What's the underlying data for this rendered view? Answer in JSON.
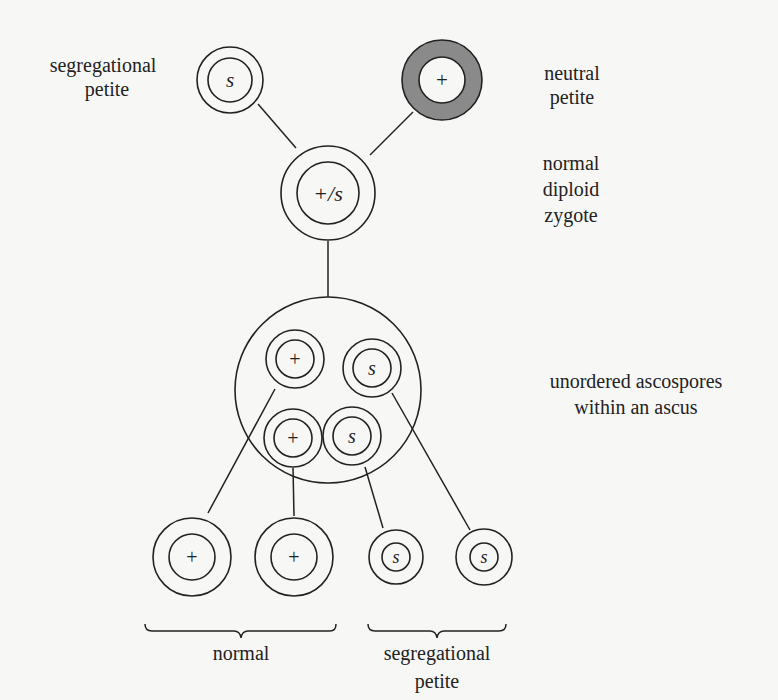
{
  "diagram": {
    "colors": {
      "background": "#f7f7f6",
      "ink": "#222222",
      "neutral_shading": "#8a8a8a"
    },
    "labels": {
      "segregational_petite_top_line1": "segregational",
      "segregational_petite_top_line2": "petite",
      "neutral_petite_line1": "neutral",
      "neutral_petite_line2": "petite",
      "zygote_line1": "normal",
      "zygote_line2": "diploid",
      "zygote_line3": "zygote",
      "ascus_line1": "unordered ascospores",
      "ascus_line2": "within an ascus",
      "normal_group": "normal",
      "seg_group_line1": "segregational",
      "seg_group_line2": "petite"
    },
    "cells": {
      "seg_parent": {
        "symbol": "s",
        "italic": true
      },
      "neutral_parent": {
        "symbol": "+",
        "italic": false,
        "shaded": true
      },
      "zygote": {
        "symbol": "+/s",
        "italic": true
      },
      "spore_1": {
        "symbol": "+"
      },
      "spore_2": {
        "symbol": "s"
      },
      "spore_3": {
        "symbol": "+"
      },
      "spore_4": {
        "symbol": "s"
      },
      "progeny_1": {
        "symbol": "+"
      },
      "progeny_2": {
        "symbol": "+"
      },
      "progeny_3": {
        "symbol": "s"
      },
      "progeny_4": {
        "symbol": "s"
      }
    }
  }
}
